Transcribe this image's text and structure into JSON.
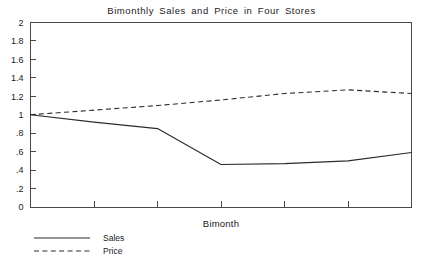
{
  "chart_data": {
    "type": "line",
    "title": "Bimonthly  Sales  and  Price  in  Four  Stores",
    "xlabel": "Bimonth",
    "ylabel": "",
    "grid": false,
    "legend_position": "bottom-left",
    "xlim": [
      0,
      6
    ],
    "ylim": [
      0,
      2
    ],
    "x": [
      0,
      1,
      2,
      3,
      4,
      5,
      6
    ],
    "yticks": [
      0,
      0.2,
      0.4,
      0.6,
      0.8,
      1,
      1.2,
      1.4,
      1.6,
      1.8,
      2
    ],
    "ytick_labels": [
      "0",
      ".2",
      ".4",
      ".6",
      ".8",
      "1",
      "1.2",
      "1.4",
      "1.6",
      "1.8",
      "2"
    ],
    "xtick_labels": [
      "",
      "",
      "",
      "",
      "",
      "",
      ""
    ],
    "series": [
      {
        "name": "Sales",
        "style": "solid",
        "values": [
          1.0,
          0.92,
          0.85,
          0.46,
          0.47,
          0.5,
          0.59
        ]
      },
      {
        "name": "Price",
        "style": "dashed",
        "values": [
          1.0,
          1.05,
          1.1,
          1.16,
          1.23,
          1.27,
          1.23
        ]
      }
    ]
  },
  "legend": {
    "items": [
      {
        "label": "Sales",
        "style": "solid"
      },
      {
        "label": "Price",
        "style": "dashed"
      }
    ]
  }
}
